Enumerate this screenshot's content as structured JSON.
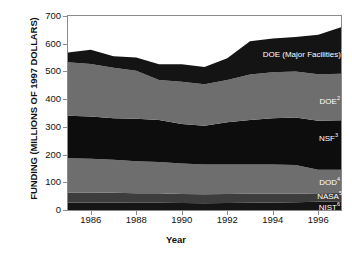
{
  "chart_data": {
    "type": "area",
    "title": "",
    "xlabel": "Year",
    "ylabel": "FUNDING (MILLIONS OF 1997 DOLLARS)",
    "xlim": [
      1985,
      1997
    ],
    "ylim": [
      0,
      700
    ],
    "grid": false,
    "legend_position": "inline-right",
    "stacked": true,
    "ytick_labels": [
      "0",
      "100",
      "200",
      "300",
      "400",
      "500",
      "600",
      "700"
    ],
    "ytick_values": [
      0,
      100,
      200,
      300,
      400,
      500,
      600,
      700
    ],
    "xtick_labels": [
      "1986",
      "1988",
      "1990",
      "1992",
      "1994",
      "1996"
    ],
    "xtick_values": [
      1986,
      1988,
      1990,
      1992,
      1994,
      1996
    ],
    "x": [
      1985,
      1986,
      1987,
      1988,
      1989,
      1990,
      1991,
      1992,
      1993,
      1994,
      1995,
      1996,
      1997
    ],
    "series": [
      {
        "name": "NIST",
        "label": "NIST",
        "superscript": "6",
        "color": "#151515",
        "values": [
          27,
          27,
          27,
          26,
          26,
          25,
          24,
          25,
          26,
          27,
          28,
          30,
          32
        ]
      },
      {
        "name": "NASA",
        "label": "NASA",
        "superscript": "5",
        "color": "#3d3d3d",
        "values": [
          36,
          36,
          35,
          34,
          34,
          33,
          33,
          33,
          33,
          32,
          31,
          30,
          29
        ]
      },
      {
        "name": "DOD",
        "label": "DOD",
        "superscript": "4",
        "color": "#6e6e6e",
        "values": [
          124,
          122,
          119,
          116,
          113,
          110,
          107,
          106,
          105,
          105,
          103,
          85,
          84
        ]
      },
      {
        "name": "NSF",
        "label": "NSF",
        "superscript": "3",
        "color": "#0d0d0d",
        "values": [
          153,
          152,
          150,
          153,
          152,
          142,
          140,
          153,
          161,
          167,
          172,
          177,
          179
        ]
      },
      {
        "name": "DOE",
        "label": "DOE",
        "superscript": "2",
        "color": "#6e6e6e",
        "values": [
          193,
          190,
          182,
          173,
          144,
          153,
          150,
          152,
          164,
          166,
          166,
          168,
          168
        ]
      },
      {
        "name": "DOE (Major Facilities)",
        "label": "DOE (Major Facilities)",
        "superscript": "1",
        "color": "#141414",
        "values": [
          35,
          51,
          42,
          48,
          57,
          63,
          62,
          79,
          120,
          122,
          124,
          142,
          167
        ]
      }
    ],
    "series_totals": [
      568,
      578,
      555,
      550,
      526,
      526,
      516,
      548,
      609,
      619,
      624,
      632,
      659
    ]
  },
  "series_labels": [
    {
      "text": "DOE (Major Facilities)",
      "sup": "1"
    },
    {
      "text": "DOE",
      "sup": "2"
    },
    {
      "text": "NSF",
      "sup": "3"
    },
    {
      "text": "DOD",
      "sup": "4"
    },
    {
      "text": "NASA",
      "sup": "5"
    },
    {
      "text": "NIST",
      "sup": "6"
    }
  ]
}
